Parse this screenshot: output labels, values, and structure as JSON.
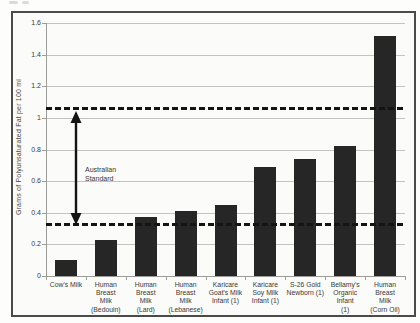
{
  "figure": {
    "kind": "scanned-book-bar-chart",
    "frame_border_color": "#4a4a4a",
    "background_color": "#fbfbf9",
    "gridline_color": "#c3c3bf",
    "axis_color": "#9c9c98",
    "text_color": "#3a3a38"
  },
  "chart_data": {
    "type": "bar",
    "title": "",
    "xlabel": "",
    "ylabel": "Grams of Polyunsaturated Fat per 100 ml",
    "ylim": [
      0,
      1.6
    ],
    "ytick_step": 0.2,
    "yticks": [
      "0",
      "0.2",
      "0.4",
      "0.6",
      "0.8",
      "1",
      "1.2",
      "1.4",
      "1.6"
    ],
    "grid": true,
    "legend": "none",
    "bar_color": "#262626",
    "categories": [
      "Cow's Milk",
      "Human Breast Milk (Bedouin)",
      "Human Breast Milk (Lard)",
      "Human Breast Milk (Lebanese)",
      "Karicare Goat's Milk Infant (1)",
      "Karicare Soy Milk Infant (1)",
      "S-26 Gold Newborn (1)",
      "Bellamy's Organic Infant (1)",
      "Human Breast Milk (Corn Oil)"
    ],
    "category_lines": [
      [
        "Cow's Milk"
      ],
      [
        "Human",
        "Breast",
        "Milk",
        "(Bedouin)"
      ],
      [
        "Human",
        "Breast",
        "Milk",
        "(Lard)"
      ],
      [
        "Human",
        "Breast",
        "Milk",
        "(Lebanese)"
      ],
      [
        "Karicare",
        "Goat's Milk",
        "Infant (1)"
      ],
      [
        "Karicare",
        "Soy Milk",
        "Infant (1)"
      ],
      [
        "S-26 Gold",
        "Newborn (1)"
      ],
      [
        "Bellamy's",
        "Organic",
        "Infant",
        "(1)"
      ],
      [
        "Human",
        "Breast",
        "Milk",
        "(Corn Oil)"
      ]
    ],
    "values": [
      0.1,
      0.23,
      0.37,
      0.41,
      0.45,
      0.69,
      0.74,
      0.82,
      1.52
    ],
    "reference_lines": {
      "upper": 1.06,
      "lower": 0.33,
      "style": "dashed",
      "color": "#141414"
    },
    "annotation": {
      "text": "Australian Standard",
      "placement": "double-headed arrow between dashed reference lines"
    }
  }
}
